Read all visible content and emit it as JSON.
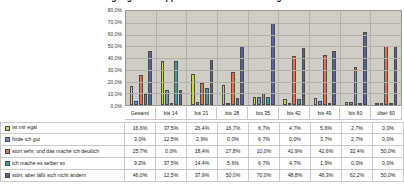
{
  "chart_data": {
    "type": "bar",
    "title": "Umgang mit Gruppen - Verhalten weiterhin gesamt",
    "xlabel": "",
    "ylabel": "",
    "ylim": [
      0,
      80
    ],
    "grid": true,
    "legend_position": "table",
    "ytick_labels": [
      "80,0%",
      "70,0%",
      "60,0%",
      "50,0%",
      "40,0%",
      "30,0%",
      "20,0%",
      "10,0%",
      "0,0%"
    ],
    "ytick_values": [
      80,
      70,
      60,
      50,
      40,
      30,
      20,
      10,
      0
    ],
    "categories": [
      "Gesamt",
      "bis 14",
      "bis 21",
      "bis 28",
      "bis 35",
      "bis 42",
      "bis 49",
      "bis 60",
      "über 60"
    ],
    "series": [
      {
        "name": "ist mir egal",
        "color": "#cdd64a",
        "values": [
          16.6,
          37.5,
          26.4,
          16.7,
          6.7,
          4.7,
          5.6,
          2.7,
          0.0
        ],
        "labels": [
          "16,6%",
          "37,5%",
          "26,4%",
          "16,7%",
          "6,7%",
          "4,7%",
          "5,6%",
          "2,7%",
          "0,0%"
        ]
      },
      {
        "name": "finde ich gut",
        "color": "#6f93c4",
        "values": [
          3.0,
          12.5,
          2.9,
          0.0,
          6.7,
          0.0,
          3.7,
          2.7,
          0.0
        ],
        "labels": [
          "3,0%",
          "12,5%",
          "2,9%",
          "0,0%",
          "6,7%",
          "0,0%",
          "3,7%",
          "2,7%",
          "0,0%"
        ]
      },
      {
        "name": "stört sehr, und das mache ich deutlich",
        "color": "#e8704a",
        "values": [
          25.7,
          0.0,
          18.4,
          27.8,
          10.0,
          41.9,
          42.6,
          32.4,
          50.0
        ],
        "labels": [
          "25,7%",
          "0,0%",
          "18,4%",
          "27,8%",
          "10,0%",
          "41,9%",
          "42,6%",
          "32,4%",
          "50,0%"
        ]
      },
      {
        "name": "ich mache es selber so",
        "color": "#3f9e9e",
        "values": [
          9.2,
          37.5,
          14.4,
          5.6,
          6.7,
          4.7,
          1.9,
          0.0,
          0.0
        ],
        "labels": [
          "9,2%",
          "37,5%",
          "14,4%",
          "5,6%",
          "6,7%",
          "4,7%",
          "1,9%",
          "0,0%",
          "0,0%"
        ]
      },
      {
        "name": "stört, aber läßt sich nicht ändern",
        "color": "#55639e",
        "values": [
          46.0,
          12.5,
          37.9,
          50.0,
          70.0,
          48.8,
          46.3,
          62.2,
          50.0
        ],
        "labels": [
          "46,0%",
          "12,5%",
          "37,9%",
          "50,0%",
          "70,0%",
          "48,8%",
          "46,3%",
          "62,2%",
          "50,0%"
        ]
      }
    ]
  }
}
